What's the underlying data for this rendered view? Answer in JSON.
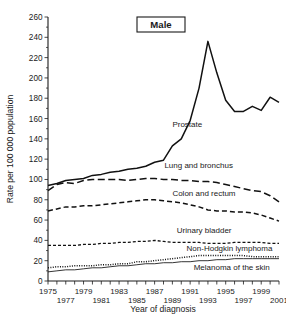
{
  "panel": {
    "title": "Male"
  },
  "axes": {
    "ylabel": "Rate per 100 000 population",
    "xlabel": "Year of diagnosis",
    "ylim": [
      0,
      260
    ],
    "ytick_step": 20,
    "yticks": [
      0,
      20,
      40,
      60,
      80,
      100,
      120,
      140,
      160,
      180,
      200,
      220,
      240,
      260
    ],
    "xlim": [
      1975,
      2001
    ],
    "xticks_top_row": [
      1975,
      1979,
      1983,
      1987,
      1991,
      1995,
      1999
    ],
    "xticks_bottom_row": [
      1977,
      1981,
      1985,
      1989,
      1993,
      1997,
      2001
    ],
    "grid": false,
    "legend_position": "inline-annotations"
  },
  "chart_data": {
    "type": "line",
    "title": "Male",
    "xlabel": "Year of diagnosis",
    "ylabel": "Rate per 100 000 population",
    "ylim": [
      0,
      260
    ],
    "xlim": [
      1975,
      2001
    ],
    "grid": false,
    "legend_position": "inline-annotations",
    "x": [
      1975,
      1976,
      1977,
      1978,
      1979,
      1980,
      1981,
      1982,
      1983,
      1984,
      1985,
      1986,
      1987,
      1988,
      1989,
      1990,
      1991,
      1992,
      1993,
      1994,
      1995,
      1996,
      1997,
      1998,
      1999,
      2000,
      2001
    ],
    "series": [
      {
        "name": "Prostate",
        "style": "solid-thick",
        "values": [
          94,
          96,
          99,
          100,
          101,
          104,
          105,
          107,
          108,
          110,
          111,
          113,
          117,
          119,
          133,
          140,
          158,
          190,
          236,
          205,
          178,
          167,
          167,
          172,
          168,
          181,
          176
        ]
      },
      {
        "name": "Lung and bronchus",
        "style": "long-dash",
        "values": [
          89,
          95,
          97,
          96,
          99,
          100,
          100,
          100,
          100,
          99,
          100,
          101,
          101,
          100,
          100,
          99,
          99,
          98,
          98,
          97,
          95,
          93,
          91,
          89,
          88,
          84,
          78
        ]
      },
      {
        "name": "Colon and rectum",
        "style": "medium-dash",
        "values": [
          69,
          71,
          73,
          73,
          74,
          74,
          75,
          76,
          77,
          78,
          79,
          80,
          80,
          79,
          78,
          77,
          75,
          73,
          70,
          69,
          69,
          68,
          68,
          67,
          65,
          62,
          59
        ]
      },
      {
        "name": "Urinary bladder",
        "style": "short-dash",
        "values": [
          35,
          35,
          35,
          35,
          36,
          36,
          37,
          37,
          38,
          38,
          39,
          39,
          40,
          39,
          38,
          38,
          38,
          38,
          37,
          37,
          37,
          38,
          38,
          38,
          38,
          37,
          37
        ]
      },
      {
        "name": "Non-Hodgkin lymphoma",
        "style": "dotted",
        "values": [
          13,
          14,
          14,
          15,
          15,
          15,
          16,
          16,
          17,
          17,
          19,
          19,
          20,
          21,
          22,
          23,
          24,
          25,
          25,
          25,
          25,
          25,
          25,
          24,
          24,
          24,
          24
        ]
      },
      {
        "name": "Melanoma of the skin",
        "style": "solid-thin",
        "values": [
          9,
          10,
          11,
          11,
          12,
          13,
          13,
          14,
          15,
          15,
          16,
          17,
          17,
          18,
          18,
          19,
          19,
          20,
          20,
          21,
          21,
          22,
          22,
          22,
          22,
          22,
          22
        ]
      }
    ]
  },
  "annotations": [
    {
      "text": "Prostate",
      "x": 1989.0,
      "y": 152
    },
    {
      "text": "Lung and bronchus",
      "x": 1988.1,
      "y": 111
    },
    {
      "text": "Colon and rectum",
      "x": 1989.0,
      "y": 84
    },
    {
      "text": "Urinary bladder",
      "x": 1989.5,
      "y": 47
    },
    {
      "text": "Non-Hodgkin lymphoma",
      "x": 1990.6,
      "y": 29.5
    },
    {
      "text": "Melanoma of the skin",
      "x": 1991.4,
      "y": 11
    }
  ]
}
